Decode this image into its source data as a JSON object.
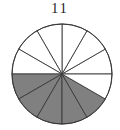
{
  "figure": {
    "label": "11",
    "caption_position": "top-center"
  },
  "colors": {
    "shaded": "#808080",
    "unshaded": "#ffffff",
    "outline": "#3a3a3a",
    "label": "#1a1a1a",
    "background": "#ffffff"
  },
  "geometry": {
    "center_x": 62,
    "center_y": 74,
    "radius": 50
  },
  "chart_data": {
    "type": "pie",
    "title": "11",
    "xlabel": "",
    "ylabel": "",
    "legend": "none",
    "grid": false,
    "slice_count": 12,
    "slice_angle_degrees": 30,
    "start_angle_degrees": 0,
    "direction": "counterclockwise",
    "categories": [
      "s1",
      "s2",
      "s3",
      "s4",
      "s5",
      "s6",
      "s7",
      "s8",
      "s9",
      "s10",
      "s11",
      "s12"
    ],
    "values": [
      30,
      30,
      30,
      30,
      30,
      30,
      30,
      30,
      30,
      30,
      30,
      30
    ],
    "slices": [
      {
        "index": 1,
        "start": 0,
        "end": 30,
        "state": "unshaded",
        "fill": "#ffffff"
      },
      {
        "index": 2,
        "start": 30,
        "end": 60,
        "state": "unshaded",
        "fill": "#ffffff"
      },
      {
        "index": 3,
        "start": 60,
        "end": 90,
        "state": "unshaded",
        "fill": "#ffffff"
      },
      {
        "index": 4,
        "start": 90,
        "end": 120,
        "state": "unshaded",
        "fill": "#ffffff"
      },
      {
        "index": 5,
        "start": 120,
        "end": 150,
        "state": "unshaded",
        "fill": "#ffffff"
      },
      {
        "index": 6,
        "start": 150,
        "end": 180,
        "state": "unshaded",
        "fill": "#ffffff"
      },
      {
        "index": 7,
        "start": 180,
        "end": 210,
        "state": "shaded",
        "fill": "#808080"
      },
      {
        "index": 8,
        "start": 210,
        "end": 240,
        "state": "shaded",
        "fill": "#808080"
      },
      {
        "index": 9,
        "start": 240,
        "end": 270,
        "state": "shaded",
        "fill": "#808080"
      },
      {
        "index": 10,
        "start": 270,
        "end": 300,
        "state": "shaded",
        "fill": "#808080"
      },
      {
        "index": 11,
        "start": 300,
        "end": 330,
        "state": "shaded",
        "fill": "#808080"
      },
      {
        "index": 12,
        "start": 330,
        "end": 360,
        "state": "unshaded",
        "fill": "#ffffff"
      }
    ],
    "shaded_count": 5,
    "unshaded_count": 7
  }
}
